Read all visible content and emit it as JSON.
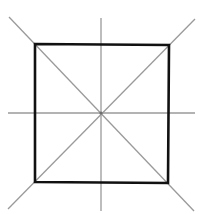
{
  "figure": {
    "square": {
      "corners": {
        "top_left": [
          35,
          44
        ],
        "top_right": [
          169,
          45
        ],
        "bottom_right": [
          168,
          183
        ],
        "bottom_left": [
          35,
          182
        ]
      },
      "stroke_color": "#111111"
    },
    "center": [
      101,
      113
    ],
    "symmetry_lines": {
      "count": 4,
      "color": "#9a9a9a",
      "vertical": {
        "x1": 101,
        "y1": 18,
        "x2": 101,
        "y2": 211
      },
      "horizontal": {
        "x1": 8,
        "y1": 113,
        "x2": 195,
        "y2": 113
      },
      "diagonal_main": {
        "x1": 9,
        "y1": 17,
        "x2": 194,
        "y2": 211
      },
      "diagonal_anti": {
        "x1": 195,
        "y1": 19,
        "x2": 8,
        "y2": 209
      }
    }
  }
}
